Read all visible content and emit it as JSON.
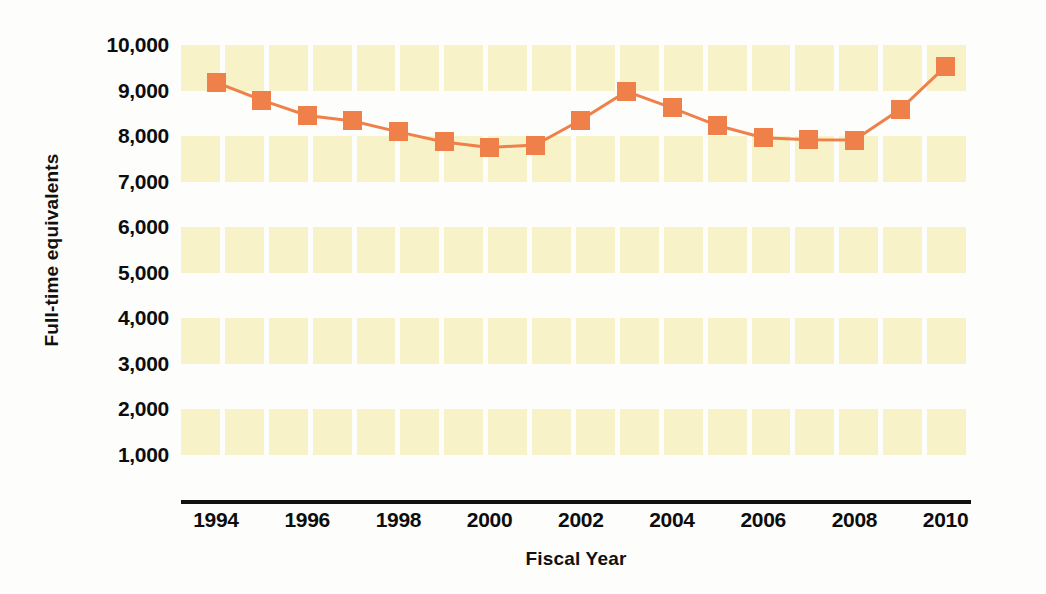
{
  "chart_data": {
    "type": "line",
    "title": "",
    "xlabel": "Fiscal Year",
    "ylabel": "Full-time equivalents",
    "xlim": [
      1993,
      2011
    ],
    "ylim": [
      0,
      10000
    ],
    "grid": true,
    "legend": false,
    "marker_shape": "square",
    "series_color": "#ef8049",
    "band_color": "#f7f2c8",
    "background_color": "#ffffff",
    "axis_color": "#111111",
    "x": [
      1994,
      1995,
      1996,
      1997,
      1998,
      1999,
      2000,
      2001,
      2002,
      2003,
      2004,
      2005,
      2006,
      2007,
      2008,
      2009,
      2010
    ],
    "values": [
      9180,
      8790,
      8450,
      8330,
      8090,
      7870,
      7750,
      7800,
      8350,
      8980,
      8620,
      8230,
      7960,
      7920,
      7910,
      8580,
      9530
    ],
    "y_ticks": [
      {
        "value": 10000,
        "label": "10,000"
      },
      {
        "value": 9000,
        "label": "9,000"
      },
      {
        "value": 8000,
        "label": "8,000"
      },
      {
        "value": 7000,
        "label": "7,000"
      },
      {
        "value": 6000,
        "label": "6,000"
      },
      {
        "value": 5000,
        "label": "5,000"
      },
      {
        "value": 4000,
        "label": "4,000"
      },
      {
        "value": 3000,
        "label": "3,000"
      },
      {
        "value": 2000,
        "label": "2,000"
      },
      {
        "value": 1000,
        "label": "1,000"
      }
    ],
    "x_ticks": [
      {
        "value": 1994,
        "label": "1994"
      },
      {
        "value": 1996,
        "label": "1996"
      },
      {
        "value": 1998,
        "label": "1998"
      },
      {
        "value": 2000,
        "label": "2000"
      },
      {
        "value": 2002,
        "label": "2002"
      },
      {
        "value": 2004,
        "label": "2004"
      },
      {
        "value": 2006,
        "label": "2006"
      },
      {
        "value": 2008,
        "label": "2008"
      },
      {
        "value": 2010,
        "label": "2010"
      }
    ],
    "bands": [
      {
        "from": 10000,
        "to": 9000
      },
      {
        "from": 8000,
        "to": 7000
      },
      {
        "from": 6000,
        "to": 5000
      },
      {
        "from": 4000,
        "to": 3000
      },
      {
        "from": 2000,
        "to": 1000
      }
    ]
  }
}
